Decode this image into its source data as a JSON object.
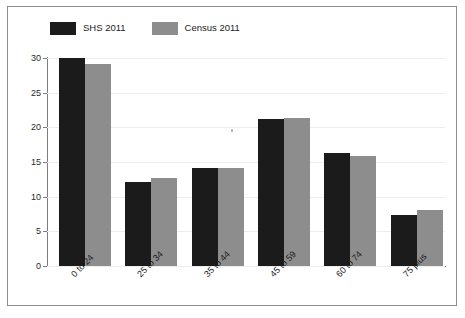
{
  "figure": {
    "y_axis_title": "Percentage in age group",
    "legend": [
      {
        "label": "SHS 2011",
        "color": "#1b1b1b",
        "swatch": "legend-swatch-shs"
      },
      {
        "label": "Census 2011",
        "color": "#8d8d8d",
        "swatch": "legend-swatch-census"
      }
    ],
    "y_tick_labels": [
      "0",
      "5",
      "10",
      "15",
      "20",
      "25",
      "30"
    ],
    "x_tick_labels": [
      "0 to 24",
      "25 to 34",
      "35 to 44",
      "45 to 59",
      "60 to 74",
      "75 plus"
    ]
  },
  "chart_data": {
    "type": "bar",
    "title": "",
    "xlabel": "",
    "ylabel": "Percentage in age group",
    "ylim": [
      0,
      30
    ],
    "yticks": [
      0,
      5,
      10,
      15,
      20,
      25,
      30
    ],
    "grid": true,
    "legend_position": "top-left",
    "categories": [
      "0 to 24",
      "25 to 34",
      "35 to 44",
      "45 to 59",
      "60 to 74",
      "75 plus"
    ],
    "series": [
      {
        "name": "SHS 2011",
        "color": "#1b1b1b",
        "values": [
          30.0,
          12.1,
          14.2,
          21.2,
          16.3,
          7.4
        ]
      },
      {
        "name": "Census 2011",
        "color": "#8d8d8d",
        "values": [
          29.2,
          12.7,
          14.1,
          21.4,
          15.8,
          8.1
        ]
      }
    ]
  }
}
